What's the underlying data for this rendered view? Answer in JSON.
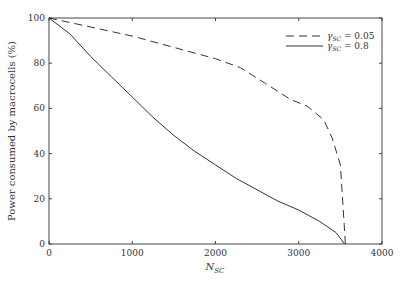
{
  "chart_data": {
    "type": "line",
    "title": "",
    "xlabel": "N_SC",
    "ylabel": "Power consumed by macrocells (%)",
    "xlim": [
      0,
      4000
    ],
    "ylim": [
      0,
      100
    ],
    "xticks": [
      0,
      1000,
      2000,
      3000,
      4000
    ],
    "yticks": [
      0,
      20,
      40,
      60,
      80,
      100
    ],
    "grid": false,
    "legend_position": "upper right",
    "series": [
      {
        "name": "γ_SC = 0.05",
        "style": "dashed",
        "color": "#333333",
        "x": [
          0,
          500,
          1000,
          1500,
          2000,
          2300,
          2600,
          2900,
          3100,
          3300,
          3400,
          3500,
          3560
        ],
        "y": [
          100,
          96,
          92,
          87,
          82,
          78,
          71,
          64,
          61,
          55,
          47,
          35,
          0
        ]
      },
      {
        "name": "γ_SC = 0.8",
        "style": "solid",
        "color": "#333333",
        "x": [
          0,
          250,
          500,
          750,
          1000,
          1250,
          1500,
          1750,
          2000,
          2250,
          2500,
          2750,
          3000,
          3250,
          3450,
          3550
        ],
        "y": [
          100,
          93,
          83,
          74,
          65,
          56,
          48,
          41,
          35,
          29,
          24,
          19,
          15,
          10,
          5,
          0
        ]
      }
    ]
  },
  "labels": {
    "xlabel_main": "N",
    "xlabel_sub": "SC",
    "ylabel": "Power consumed by macrocells (%)",
    "legend": [
      {
        "prefix": "γ",
        "sub": "SC",
        "suffix": " = 0.05"
      },
      {
        "prefix": "γ",
        "sub": "SC",
        "suffix": " = 0.8"
      }
    ]
  }
}
